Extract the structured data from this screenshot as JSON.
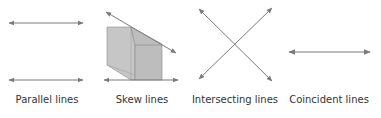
{
  "diagram": {
    "panels": [
      {
        "id": "parallel",
        "label": "Parallel lines"
      },
      {
        "id": "skew",
        "label": "Skew lines"
      },
      {
        "id": "intersecting",
        "label": "Intersecting lines"
      },
      {
        "id": "coincident",
        "label": "Coincident lines"
      }
    ],
    "colors": {
      "line": "#7a7a7a",
      "box_fill": "#c4c4c4",
      "box_edge": "#8a8a8a",
      "text": "#333333"
    }
  }
}
